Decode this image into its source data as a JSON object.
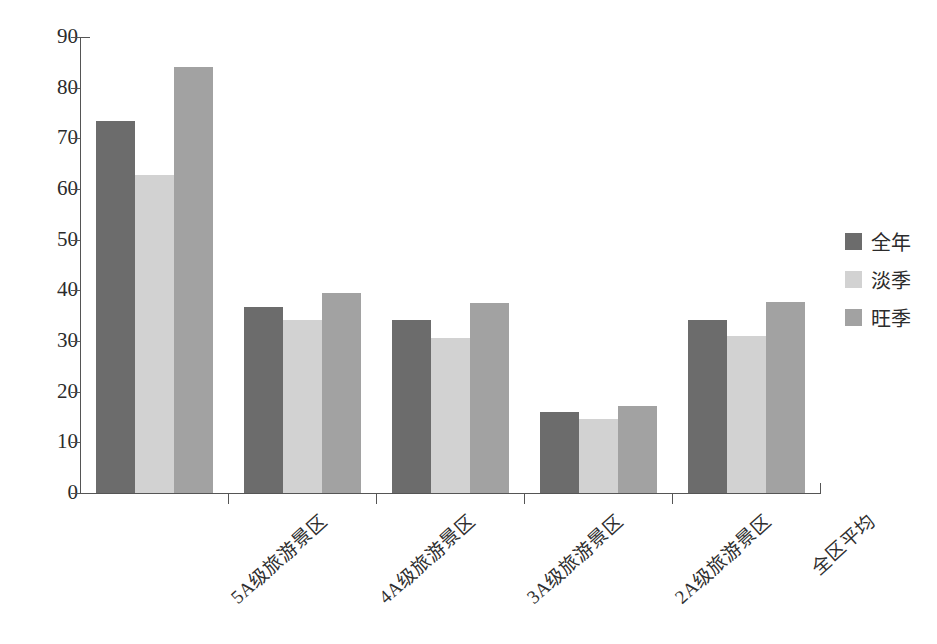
{
  "chart_data": {
    "type": "bar",
    "title": "",
    "xlabel": "",
    "ylabel": "平均门票价格（元/景区）",
    "ylim": [
      0,
      90
    ],
    "yticks": [
      0,
      10,
      20,
      30,
      40,
      50,
      60,
      70,
      80,
      90
    ],
    "ytick_labels": [
      "0",
      "10",
      "20",
      "30",
      "40",
      "50",
      "60",
      "70",
      "80",
      "90"
    ],
    "grid": false,
    "legend_position": "right",
    "categories": [
      "5A级旅游景区",
      "4A级旅游景区",
      "3A级旅游景区",
      "2A级旅游景区",
      "全区平均"
    ],
    "series": [
      {
        "name": "全年",
        "color": "#6c6c6c",
        "values": [
          73.4,
          36.8,
          34.1,
          16.0,
          34.2
        ]
      },
      {
        "name": "淡季",
        "color": "#d2d2d2",
        "values": [
          62.8,
          34.1,
          30.5,
          14.6,
          30.9
        ]
      },
      {
        "name": "旺季",
        "color": "#a2a2a2",
        "values": [
          84.0,
          39.5,
          37.6,
          17.2,
          37.7
        ]
      }
    ]
  }
}
